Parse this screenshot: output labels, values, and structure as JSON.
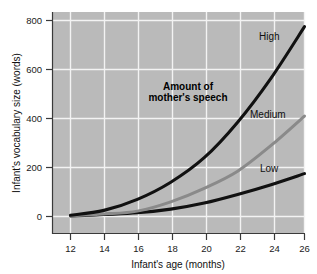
{
  "chart_data": {
    "type": "line",
    "title": "",
    "subtitle": "",
    "xlabel": "Infant's age (months)",
    "ylabel": "Infant's vocabulary size (words)",
    "xlim": [
      11,
      27
    ],
    "ylim": [
      -40,
      830
    ],
    "xticks": [
      "12",
      "14",
      "16",
      "18",
      "20",
      "22",
      "24",
      "26"
    ],
    "xtick_values": [
      12,
      14,
      16,
      18,
      20,
      22,
      24,
      26
    ],
    "yticks": [
      "0",
      "200",
      "400",
      "600",
      "800"
    ],
    "ytick_values": [
      0,
      200,
      400,
      600,
      800
    ],
    "grid": true,
    "grid_color": "#f2f2f2",
    "plot_background": "#b9b9b9",
    "figure_background": "#ffffff",
    "legend_position": "inline-end-of-line",
    "annotation": {
      "line1": "Amount of",
      "line2": "mother's speech"
    },
    "x": [
      12,
      14,
      16,
      18,
      20,
      22,
      24,
      26
    ],
    "series": [
      {
        "name": "High",
        "label": "High",
        "color": "#111111",
        "width": 3.1,
        "values": [
          5,
          25,
          70,
          140,
          240,
          385,
          565,
          775
        ]
      },
      {
        "name": "Medium",
        "label": "Medium",
        "color": "#8a8a8a",
        "width": 3.0,
        "values": [
          3,
          10,
          22,
          60,
          115,
          185,
          290,
          410
        ]
      },
      {
        "name": "Low",
        "label": "Low",
        "color": "#111111",
        "width": 3.1,
        "values": [
          2,
          8,
          15,
          30,
          55,
          90,
          130,
          175
        ]
      }
    ]
  },
  "axes": {
    "x_axis_title": "Infant's age (months)",
    "y_axis_title": "Infant's vocabulary size (words)"
  }
}
